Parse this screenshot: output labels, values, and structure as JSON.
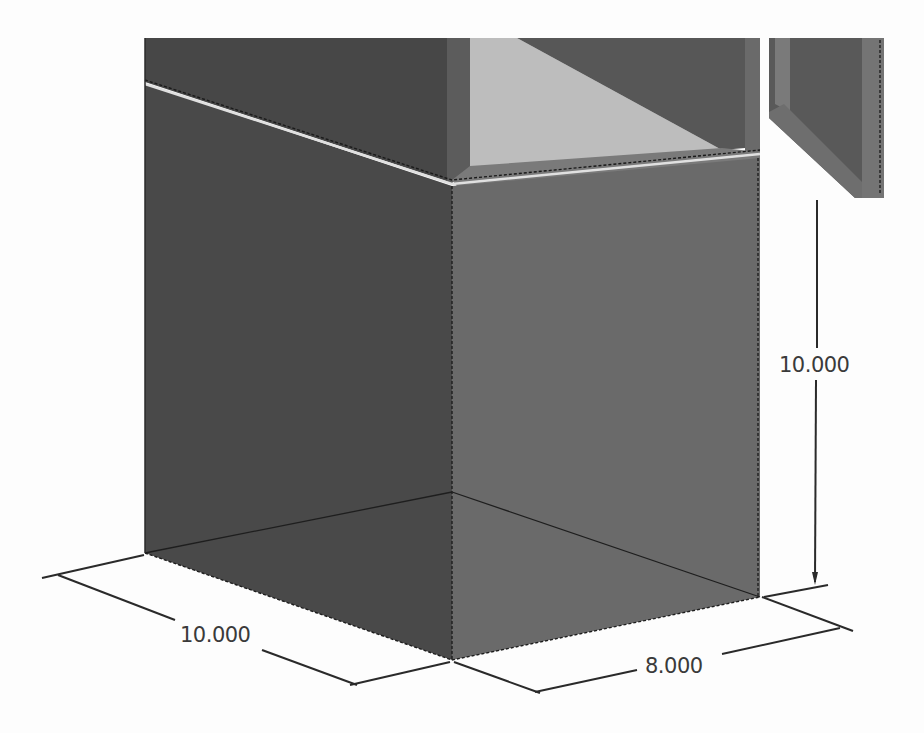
{
  "drawing": {
    "type": "isometric CAD view",
    "colors": {
      "background": "#fdfdfd",
      "left_face": "#4a4a4a",
      "right_face": "#6b6b6b",
      "upper_left_face": "#474747",
      "interior_light": "#bdbdbd",
      "interior_back": "#5a5a5a",
      "trim": "#777777",
      "highlight": "#e6e6e6",
      "dimension_text": "#3a3a3a"
    },
    "parts": [
      "base-box",
      "upper-cabinet",
      "open-door"
    ]
  },
  "dimensions": {
    "height": {
      "label": "10.000",
      "value": 10.0
    },
    "width_left": {
      "label": "10.000",
      "value": 10.0
    },
    "depth_right": {
      "label": "8.000",
      "value": 8.0
    }
  }
}
